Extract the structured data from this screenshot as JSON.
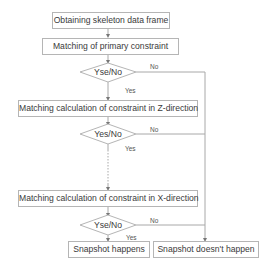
{
  "diagram": {
    "type": "flowchart",
    "nodes": {
      "obtain": "Obtaining skeleton data frame",
      "primary": "Matching of primary constraint",
      "decision1": "Yse/No",
      "z_match": "Matching calculation of constraint in Z-direction",
      "decision2": "Yes/No",
      "x_match": "Matching calculation of constraint in X-direction",
      "decision3": "Yse/No",
      "happens": "Snapshot happens",
      "not_happen": "Snapshot doesn't happen"
    },
    "edge_labels": {
      "d1_yes": "Yes",
      "d1_no": "No",
      "d2_yes": "Yes",
      "d2_no": "No",
      "d3_yes": "Yes",
      "d3_no": "No"
    },
    "colors": {
      "line": "#a8a8a8",
      "border": "#b5b5b5",
      "text": "#3a3a3a"
    }
  }
}
